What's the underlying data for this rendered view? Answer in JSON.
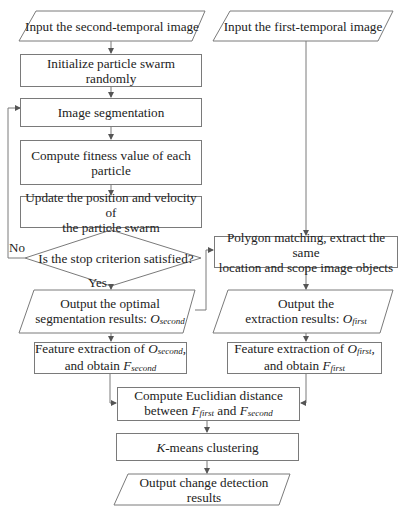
{
  "diagram": {
    "nodes": {
      "input_second": {
        "shape": "parallelogram",
        "lines": [
          "Input the second-temporal image"
        ]
      },
      "input_first": {
        "shape": "parallelogram",
        "lines": [
          "Input the first-temporal image"
        ]
      },
      "init_pso": {
        "shape": "rectangle",
        "lines": [
          "Initialize particle swarm randomly"
        ]
      },
      "segmentation": {
        "shape": "rectangle",
        "lines": [
          "Image segmentation"
        ]
      },
      "fitness": {
        "shape": "rectangle",
        "lines": [
          "Compute fitness value of each",
          "particle"
        ]
      },
      "update": {
        "shape": "rectangle",
        "lines": [
          "Update the position and velocity of",
          "the particle swarm"
        ]
      },
      "decision": {
        "shape": "diamond",
        "lines": [
          "Is the stop criterion satisfied?"
        ]
      },
      "polygon": {
        "shape": "rectangle",
        "lines": [
          "Polygon matching, extract the same",
          "location and scope image objects"
        ]
      },
      "output_optimal": {
        "shape": "parallelogram",
        "line1": "Output the optimal",
        "line2_prefix": "segmentation results: ",
        "var": "O",
        "var_sub": "second"
      },
      "output_extraction": {
        "shape": "parallelogram",
        "line1": "Output the",
        "line2_prefix": "extraction results: ",
        "var": "O",
        "var_sub": "first"
      },
      "feature_second": {
        "shape": "rectangle",
        "line1_prefix": "Feature extraction of ",
        "var1": "O",
        "var1_sub": "second",
        "line1_suffix": ",",
        "line2_prefix": "and obtain ",
        "var2": "F",
        "var2_sub": "second"
      },
      "feature_first": {
        "shape": "rectangle",
        "line1_prefix": "Feature extraction of ",
        "var1": "O",
        "var1_sub": "first",
        "line1_suffix": ",",
        "line2_prefix": "and obtain ",
        "var2": "F",
        "var2_sub": "first"
      },
      "euclid": {
        "shape": "rectangle",
        "line1": "Compute Euclidian distance",
        "line2_prefix": "between ",
        "var1": "F",
        "var1_sub": "first",
        "mid": " and ",
        "var2": "F",
        "var2_sub": "second"
      },
      "kmeans": {
        "shape": "rectangle",
        "var": "K",
        "suffix": "-means clustering"
      },
      "output_change": {
        "shape": "parallelogram",
        "lines": [
          "Output change detection results"
        ]
      }
    },
    "edge_labels": {
      "no": "No",
      "yes": "Yes"
    },
    "colors": {
      "stroke": "#7a7a7a",
      "text": "#222222",
      "background": "#ffffff"
    }
  }
}
